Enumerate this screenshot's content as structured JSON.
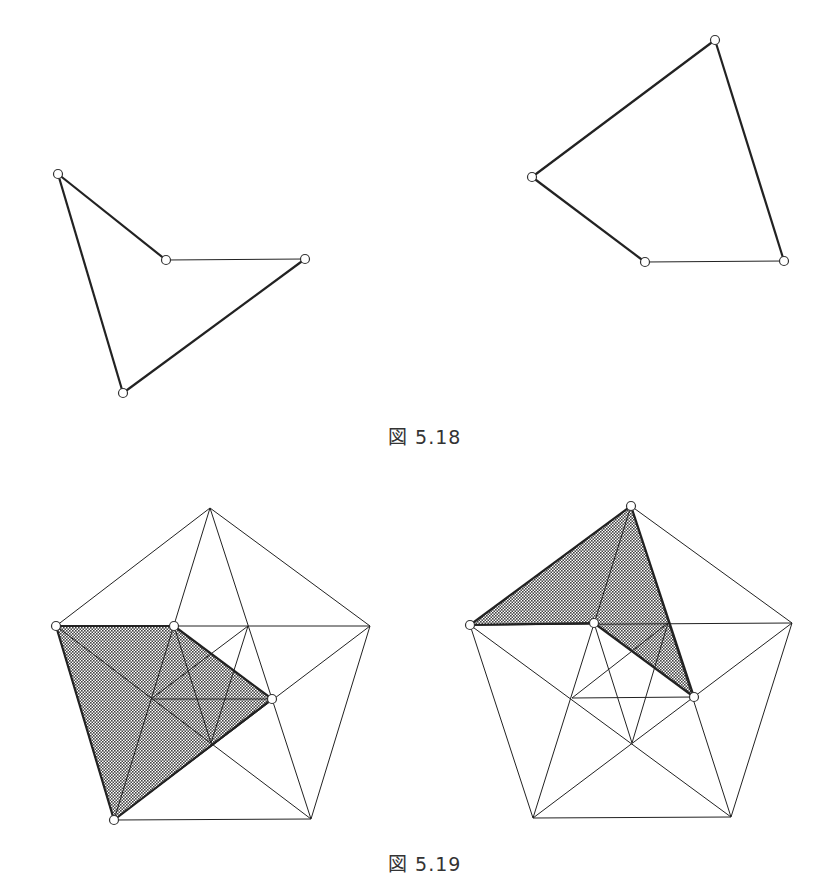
{
  "figures": [
    {
      "id": "fig-5-18",
      "caption": "図 5.18",
      "caption_pos": [
        388,
        422
      ],
      "polygons": [
        {
          "name": "concave-quadrilateral",
          "vertices": [
            [
              58,
              174
            ],
            [
              166,
              260
            ],
            [
              305,
              259
            ],
            [
              123,
              393
            ]
          ]
        },
        {
          "name": "convex-quadrilateral",
          "vertices": [
            [
              715,
              40
            ],
            [
              532,
              177
            ],
            [
              645,
              262
            ],
            [
              784,
              261
            ]
          ]
        }
      ]
    },
    {
      "id": "fig-5-19",
      "caption": "図 5.19",
      "caption_pos": [
        388,
        849
      ],
      "pentagons": [
        {
          "name": "left-pentagon",
          "outer": {
            "top": [
              210,
              508
            ],
            "left": [
              56,
              626
            ],
            "right": [
              370,
              626
            ],
            "bl": [
              114,
              820
            ],
            "br": [
              311,
              819
            ]
          },
          "inner": {
            "p1": [
              174,
              626
            ],
            "q": [
              248,
              626
            ],
            "p2": [
              272,
              699
            ],
            "s": [
              211,
              743
            ],
            "r": [
              151,
              699
            ]
          },
          "shaded": [
            [
              56,
              626
            ],
            [
              174,
              626
            ],
            [
              272,
              699
            ],
            [
              114,
              820
            ]
          ],
          "marked_vertices": [
            [
              56,
              626
            ],
            [
              174,
              626
            ],
            [
              272,
              699
            ],
            [
              114,
              820
            ]
          ]
        },
        {
          "name": "right-pentagon",
          "outer": {
            "top": [
              631,
              506
            ],
            "left": [
              470,
              625
            ],
            "right": [
              792,
              623
            ],
            "bl": [
              533,
              818
            ],
            "br": [
              731,
              817
            ]
          },
          "inner": {
            "p1": [
              594,
              623
            ],
            "q": [
              668,
              623
            ],
            "p2": [
              694,
              697
            ],
            "s": [
              632,
              743
            ],
            "r": [
              572,
              698
            ]
          },
          "shaded": [
            [
              470,
              625
            ],
            [
              631,
              506
            ],
            [
              694,
              697
            ],
            [
              594,
              623
            ]
          ],
          "marked_vertices": [
            [
              470,
              625
            ],
            [
              631,
              506
            ],
            [
              694,
              697
            ],
            [
              594,
              623
            ]
          ]
        }
      ]
    }
  ],
  "colors": {
    "line": "#222222",
    "shade": "#555555",
    "background": "#ffffff"
  }
}
